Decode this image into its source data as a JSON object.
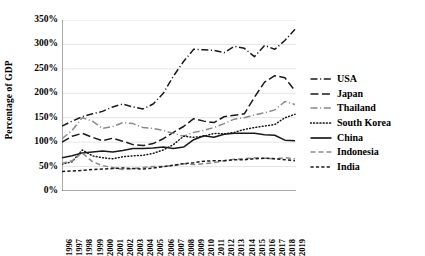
{
  "chart_data": {
    "type": "line",
    "title": "",
    "xlabel": "",
    "ylabel": "Percentage of GDP",
    "ylim": [
      0,
      350
    ],
    "yticks": [
      0,
      50,
      100,
      150,
      200,
      250,
      300,
      350
    ],
    "ytick_labels": [
      "0%",
      "50%",
      "100%",
      "150%",
      "200%",
      "250%",
      "300%",
      "350%"
    ],
    "grid": true,
    "grid_axis": "y",
    "legend_position": "right",
    "x": [
      1996,
      1997,
      1998,
      1999,
      2000,
      2001,
      2002,
      2003,
      2004,
      2005,
      2006,
      2007,
      2008,
      2009,
      2010,
      2011,
      2012,
      2013,
      2014,
      2015,
      2016,
      2017,
      2018,
      2019
    ],
    "categories": [
      "1996",
      "1997",
      "1998",
      "1999",
      "2000",
      "2001",
      "2002",
      "2003",
      "2004",
      "2005",
      "2006",
      "2007",
      "2008",
      "2009",
      "2010",
      "2011",
      "2012",
      "2013",
      "2014",
      "2015",
      "2016",
      "2017",
      "2018",
      "2019"
    ],
    "series": [
      {
        "name": "USA",
        "color": "#1a1a1a",
        "dash": "dashdot",
        "values": [
          133,
          143,
          152,
          158,
          163,
          172,
          178,
          172,
          168,
          178,
          200,
          235,
          265,
          290,
          289,
          288,
          283,
          296,
          292,
          275,
          298,
          290,
          308,
          331
        ]
      },
      {
        "name": "Japan",
        "color": "#1a1a1a",
        "dash": "longdash",
        "values": [
          100,
          112,
          118,
          110,
          103,
          108,
          102,
          95,
          93,
          97,
          107,
          120,
          132,
          148,
          143,
          140,
          152,
          155,
          158,
          192,
          223,
          236,
          232,
          205
        ]
      },
      {
        "name": "Thailand",
        "color": "#8a8a8a",
        "dash": "dashdot",
        "values": [
          107,
          124,
          150,
          143,
          128,
          132,
          140,
          138,
          130,
          128,
          124,
          118,
          112,
          120,
          124,
          130,
          138,
          147,
          150,
          156,
          160,
          166,
          183,
          177
        ]
      },
      {
        "name": "South Korea",
        "color": "#1a1a1a",
        "dash": "dotted",
        "values": [
          55,
          60,
          84,
          72,
          68,
          66,
          70,
          72,
          73,
          77,
          84,
          95,
          112,
          110,
          112,
          118,
          117,
          120,
          126,
          130,
          133,
          136,
          150,
          157
        ]
      },
      {
        "name": "China",
        "color": "#1a1a1a",
        "dash": "solid",
        "values": [
          68,
          72,
          78,
          80,
          82,
          80,
          83,
          87,
          87,
          88,
          90,
          87,
          90,
          105,
          113,
          110,
          116,
          118,
          118,
          118,
          115,
          114,
          104,
          103
        ]
      },
      {
        "name": "Indonesia",
        "color": "#8a8a8a",
        "dash": "dashed",
        "values": [
          57,
          62,
          78,
          60,
          52,
          48,
          44,
          46,
          48,
          50,
          50,
          52,
          56,
          54,
          56,
          58,
          62,
          65,
          66,
          68,
          67,
          66,
          68,
          66
        ]
      },
      {
        "name": "India",
        "color": "#1a1a1a",
        "dash": "shortdash",
        "values": [
          40,
          41,
          42,
          44,
          45,
          46,
          47,
          46,
          45,
          47,
          50,
          53,
          56,
          58,
          61,
          62,
          62,
          64,
          64,
          66,
          67,
          66,
          64,
          62
        ]
      }
    ]
  },
  "legend": {
    "items": [
      {
        "label": "USA"
      },
      {
        "label": "Japan"
      },
      {
        "label": "Thailand"
      },
      {
        "label": "South Korea"
      },
      {
        "label": "China"
      },
      {
        "label": "Indonesia"
      },
      {
        "label": "India"
      }
    ]
  }
}
